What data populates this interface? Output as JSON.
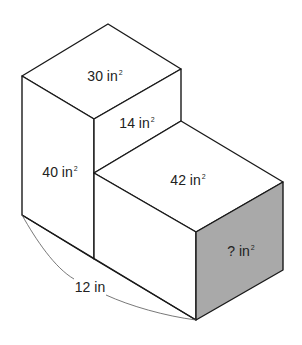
{
  "diagram": {
    "type": "composite rectangular prism surface areas",
    "faces": {
      "tall_top": {
        "value": "30",
        "unit": "in",
        "exponent": "2"
      },
      "step_back": {
        "value": "14",
        "unit": "in",
        "exponent": "2"
      },
      "tall_front": {
        "value": "40",
        "unit": "in",
        "exponent": "2"
      },
      "short_top": {
        "value": "42",
        "unit": "in",
        "exponent": "2"
      },
      "short_side": {
        "value": "?",
        "unit": "in",
        "exponent": "2",
        "shaded": true
      }
    },
    "dimension": {
      "label": "12 in"
    },
    "colors": {
      "edge": "#1a1a1a",
      "shaded_face": "#a9a9a9",
      "background": "#ffffff"
    }
  }
}
